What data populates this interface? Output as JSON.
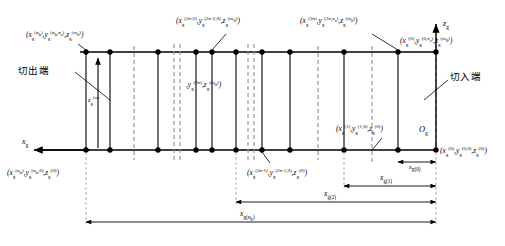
{
  "diagram": {
    "axes": {
      "z_axis": {
        "label": "z",
        "sub": "g",
        "name": "z-axis"
      },
      "x_axis": {
        "label": "x",
        "sub": "g",
        "name": "x-axis"
      },
      "origin": {
        "label": "O",
        "sub": "g"
      }
    },
    "annotations": [
      {
        "id": "cut-out",
        "text": "切出端"
      },
      {
        "id": "cut-in",
        "text": "切入端"
      }
    ],
    "node_labels": [
      {
        "id": "top-left",
        "x": "x",
        "x_sup": "(n_b)",
        "y": "y",
        "y_sup": "(n_b, n_s)",
        "z": "z",
        "z_sup": "(m_0)",
        "text": "(x_g^(n_b), y_g^(n_b,n_s), z_g^(m_0))"
      },
      {
        "id": "top-mid-left",
        "text": "(x_g^(2n-2), y_g^(2n-2,0), z_g^(m_0))"
      },
      {
        "id": "top-mid-right",
        "text": "(x_g^(2n), y_g^(2n,n_s), z_g^(m_0))"
      },
      {
        "id": "top-right",
        "text": "(x_g^(0), y_g^(0,n_s), z_g^(m_0))"
      },
      {
        "id": "mid-left-small",
        "text": "(x_g^(2n), y_g^(2n,0), z_g^(m_0))"
      },
      {
        "id": "bottom-left",
        "text": "(x_g^(n_b), y_g^(n_b,0), z_g^(0))"
      },
      {
        "id": "bottom-mid",
        "text": "(x_g^(2n-1), y_g^(2n-1,0), z_g^(0))"
      },
      {
        "id": "bottom-right-inner",
        "text": "(x_g^(1), y_g^(1,0), z_g^(0))"
      },
      {
        "id": "bottom-right-origin",
        "text": "(x_g^(0), y_g^(0,0), z_g^(0))"
      }
    ],
    "vertical_tick_label": {
      "id": "z-tick",
      "text": "z_g^(m)"
    },
    "dimensions": [
      {
        "id": "xg1",
        "base": "x",
        "sub": "g(1)",
        "text": "x_g(1)"
      },
      {
        "id": "xg2",
        "base": "x",
        "sub": "g(2)",
        "text": "x_g(2)"
      },
      {
        "id": "xgnb",
        "base": "x",
        "sub": "g(n_b)",
        "text": "x_g(n_b)"
      },
      {
        "id": "xg0",
        "base": "x",
        "sub": "g(0)",
        "text": "x_g(0)"
      }
    ],
    "colors": {
      "line": "#000000",
      "dashed": "#8a8a8a",
      "background": "#ffffff",
      "node": "#000000"
    },
    "structure": {
      "top_rail_y": 52,
      "bottom_rail_y": 150,
      "node_columns": [
        86,
        110,
        134,
        158,
        196,
        212,
        236,
        262,
        290,
        318,
        344,
        372,
        398,
        436
      ],
      "break_positions": [
        176,
        250
      ],
      "node_count": 14
    }
  }
}
